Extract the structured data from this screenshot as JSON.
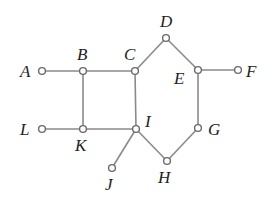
{
  "diagram": {
    "type": "graph",
    "colors": {
      "edge": "#8a8a8a",
      "node_stroke": "#6a6a6a",
      "node_fill": "#ffffff",
      "label": "#222222"
    },
    "nodes": [
      {
        "id": "A",
        "label": "A",
        "x": 42,
        "y": 71,
        "lx": 20,
        "ly": 77
      },
      {
        "id": "B",
        "label": "B",
        "x": 83,
        "y": 71,
        "lx": 77,
        "ly": 60
      },
      {
        "id": "C",
        "label": "C",
        "x": 135,
        "y": 71,
        "lx": 124,
        "ly": 60
      },
      {
        "id": "D",
        "label": "D",
        "x": 166,
        "y": 38,
        "lx": 160,
        "ly": 27
      },
      {
        "id": "E",
        "label": "E",
        "x": 198,
        "y": 70,
        "lx": 174,
        "ly": 84
      },
      {
        "id": "F",
        "label": "F",
        "x": 238,
        "y": 70,
        "lx": 246,
        "ly": 77
      },
      {
        "id": "G",
        "label": "G",
        "x": 198,
        "y": 128,
        "lx": 208,
        "ly": 135
      },
      {
        "id": "H",
        "label": "H",
        "x": 167,
        "y": 161,
        "lx": 158,
        "ly": 183
      },
      {
        "id": "I",
        "label": "I",
        "x": 136,
        "y": 129,
        "lx": 145,
        "ly": 127
      },
      {
        "id": "J",
        "label": "J",
        "x": 112,
        "y": 168,
        "lx": 105,
        "ly": 190
      },
      {
        "id": "K",
        "label": "K",
        "x": 83,
        "y": 129,
        "lx": 75,
        "ly": 151
      },
      {
        "id": "L",
        "label": "L",
        "x": 42,
        "y": 129,
        "lx": 20,
        "ly": 135
      }
    ],
    "edges": [
      [
        "A",
        "B"
      ],
      [
        "B",
        "C"
      ],
      [
        "C",
        "D"
      ],
      [
        "D",
        "E"
      ],
      [
        "E",
        "F"
      ],
      [
        "E",
        "G"
      ],
      [
        "G",
        "H"
      ],
      [
        "H",
        "I"
      ],
      [
        "I",
        "J"
      ],
      [
        "I",
        "C"
      ],
      [
        "I",
        "K"
      ],
      [
        "K",
        "L"
      ],
      [
        "K",
        "B"
      ]
    ]
  }
}
